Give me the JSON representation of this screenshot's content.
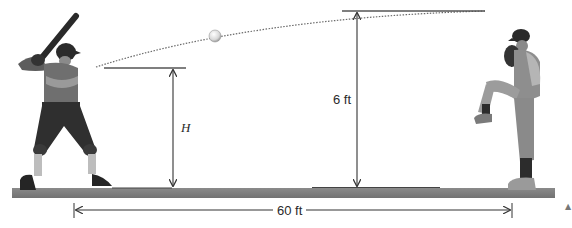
{
  "diagram": {
    "type": "physics-illustration",
    "labels": {
      "batter_height": "H",
      "pitch_release_height": "6 ft",
      "distance": "60 ft"
    },
    "figures": [
      {
        "name": "batter",
        "position": "left",
        "pose": "batting stance"
      },
      {
        "name": "pitcher",
        "position": "right",
        "pose": "wind-up, leg raised"
      },
      {
        "name": "baseball",
        "position": "in flight along dotted trajectory"
      }
    ],
    "corner_mark": "▲",
    "colors": {
      "ground": "#7c7c7c",
      "line": "#3a3a3a",
      "trajectory": "#6a6a6a",
      "text": "#2a2a2a"
    }
  }
}
